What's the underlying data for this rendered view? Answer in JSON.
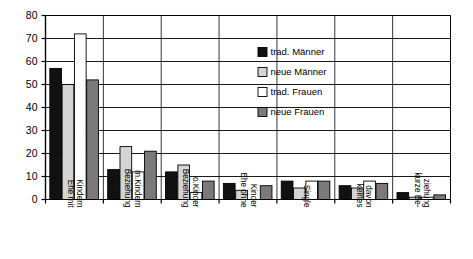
{
  "chart_data": {
    "type": "bar",
    "title": "",
    "xlabel": "",
    "ylabel": "",
    "ylim": [
      0,
      80
    ],
    "yticks": [
      0,
      10,
      20,
      30,
      40,
      50,
      60,
      70,
      80
    ],
    "grid": true,
    "legend_position": "inside-upper-right",
    "categories": [
      "Ehe mit Kindern",
      "Beziehung m.Kindern",
      "Beziehung o.Kinder",
      "Ehe ohne Kinder",
      "Single",
      "keines davon",
      "kurze Be-ziehung"
    ],
    "category_lines": [
      [
        "Ehe mit",
        "Kindern"
      ],
      [
        "Beziehung",
        "m.Kindern"
      ],
      [
        "Beziehung",
        "o.Kinder"
      ],
      [
        "Ehe ohne",
        "Kinder"
      ],
      [
        "Single"
      ],
      [
        "keines",
        "davon"
      ],
      [
        "kurze Be-",
        "ziehung"
      ]
    ],
    "series": [
      {
        "name": "trad. Männer",
        "color": "#111111",
        "values": [
          57,
          13,
          12,
          7,
          8,
          6,
          3
        ]
      },
      {
        "name": "neue Männer",
        "color": "#d4d4d4",
        "values": [
          50,
          23,
          15,
          4,
          5,
          5,
          1
        ]
      },
      {
        "name": "trad. Frauen",
        "color": "#ffffff",
        "values": [
          72,
          12,
          3,
          0,
          8,
          8,
          1
        ]
      },
      {
        "name": "neue Frauen",
        "color": "#7a7a7a",
        "values": [
          52,
          21,
          8,
          6,
          8,
          7,
          2
        ]
      }
    ]
  },
  "legend": {
    "items": [
      {
        "label": "trad. Männer",
        "swatch": "#111111"
      },
      {
        "label": "neue Männer",
        "swatch": "#d4d4d4"
      },
      {
        "label": "trad. Frauen",
        "swatch": "#ffffff"
      },
      {
        "label": "neue Frauen",
        "swatch": "#7a7a7a"
      }
    ]
  },
  "axis": {
    "y_tick_labels": [
      "80",
      "70",
      "60",
      "50",
      "40",
      "30",
      "20",
      "10",
      "0"
    ]
  },
  "colors": {
    "axis": "#000000",
    "grid": "#000000",
    "background": "#ffffff"
  }
}
